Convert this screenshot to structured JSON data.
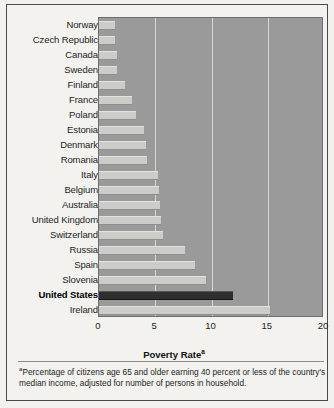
{
  "chart_data": {
    "type": "bar",
    "orientation": "horizontal",
    "title": "",
    "xlabel": "Poverty Rate",
    "xlabel_superscript": "a",
    "ylabel": "",
    "xlim": [
      0,
      20
    ],
    "xticks": [
      "0",
      "5",
      "10",
      "15",
      "20"
    ],
    "xtick_values": [
      0,
      5,
      10,
      15,
      20
    ],
    "grid": true,
    "gridlines_at": [
      5,
      10,
      15
    ],
    "legend": "none",
    "highlight_category": "United States",
    "categories": [
      "Norway",
      "Czech Republic",
      "Canada",
      "Sweden",
      "Finland",
      "France",
      "Poland",
      "Estonia",
      "Denmark",
      "Romania",
      "Italy",
      "Belgium",
      "Australia",
      "United Kingdom",
      "Switzerland",
      "Russia",
      "Spain",
      "Slovenia",
      "United States",
      "Ireland"
    ],
    "values": [
      1.4,
      1.4,
      1.6,
      1.6,
      2.3,
      2.9,
      3.3,
      4.0,
      4.2,
      4.3,
      5.2,
      5.3,
      5.4,
      5.5,
      5.7,
      7.6,
      8.5,
      9.5,
      11.9,
      15.2
    ]
  },
  "footnote": {
    "marker": "a",
    "text": "Percentage of citizens age 65 and older earning 40 percent or less of the country's median income, adjusted for number of persons in household."
  },
  "colors": {
    "bar": "#ccccc9",
    "bar_highlight": "#2f2f2f",
    "plot_background": "#9a9a9a",
    "gridline": "#d7d7d4",
    "page_background": "#f3f2ef",
    "border": "#4a4a4a"
  }
}
